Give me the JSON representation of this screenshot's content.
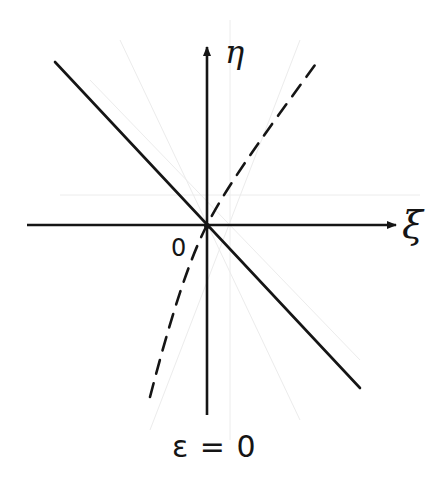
{
  "diagram": {
    "axes": {
      "x_label": "ξ",
      "y_label": "η",
      "origin_label": "0"
    },
    "caption": "ε = 0",
    "colors": {
      "ink": "#151515",
      "background": "#ffffff",
      "faint_guides": "#e6e6e6"
    },
    "elements": [
      {
        "type": "axis",
        "name": "horizontal-axis",
        "from": [
          27,
          225
        ],
        "to": [
          398,
          225
        ],
        "arrow": true
      },
      {
        "type": "axis",
        "name": "vertical-axis",
        "from": [
          207,
          415
        ],
        "to": [
          207,
          45
        ],
        "arrow": true
      },
      {
        "type": "solid-line",
        "name": "descending-line",
        "from": [
          55,
          62
        ],
        "to": [
          360,
          388
        ]
      },
      {
        "type": "dashed-curve",
        "name": "dashed-trajectory",
        "from": [
          150,
          397
        ],
        "through": [
          207,
          225
        ],
        "to": [
          315,
          65
        ]
      }
    ]
  }
}
